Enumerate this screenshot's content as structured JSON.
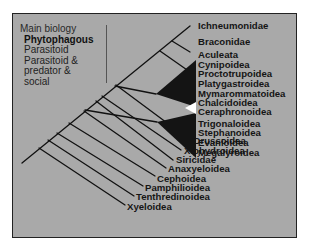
{
  "legend": {
    "title": "Main biology",
    "items": [
      {
        "label": "Phytophagous",
        "style": "bold"
      },
      {
        "label": "Parasitoid",
        "style": "regular"
      },
      {
        "label": "Parasitoid &",
        "style": "regular"
      },
      {
        "label": "predator &",
        "style": "regular"
      },
      {
        "label": "social",
        "style": "regular"
      }
    ]
  },
  "taxa": {
    "upper": [
      {
        "name": "Ichneumonidae"
      },
      {
        "name": "Braconidae"
      },
      {
        "name": "Aculeata"
      }
    ],
    "clade_a": [
      {
        "name": "Cynipoidea"
      },
      {
        "name": "Proctotrupoidea"
      },
      {
        "name": "Platygastroidea"
      },
      {
        "name": "Mymarommatoidea"
      },
      {
        "name": "Chalcidoidea"
      },
      {
        "name": "Ceraphronoidea"
      }
    ],
    "clade_b": [
      {
        "name": "Trigonaloidea"
      },
      {
        "name": "Stephanoidea"
      },
      {
        "name": "Evanioidea"
      },
      {
        "name": "Megalyroidea"
      }
    ],
    "basal": [
      {
        "name": "Orussoidea"
      },
      {
        "name": "Xiphydroidea"
      },
      {
        "name": "Siricidae"
      },
      {
        "name": "Anaxyeloidea"
      },
      {
        "name": "Cephoidea"
      },
      {
        "name": "Pamphilioidea"
      },
      {
        "name": "Tenthredinoidea"
      },
      {
        "name": "Xyeloidea"
      }
    ]
  },
  "colors": {
    "background": "#a9a9a9",
    "lines": "#111111",
    "triangle_fill": "#141414",
    "highlight_triangle": "#ffffff"
  }
}
